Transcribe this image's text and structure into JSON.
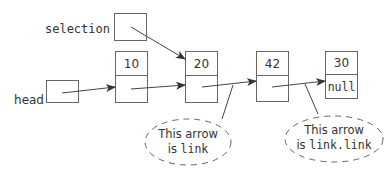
{
  "diagram": {
    "pointers": [
      {
        "name": "selection",
        "label": "selection"
      },
      {
        "name": "head",
        "label": "head"
      }
    ],
    "nodes": [
      {
        "data": "10",
        "link": ""
      },
      {
        "data": "20",
        "link": ""
      },
      {
        "data": "42",
        "link": ""
      },
      {
        "data": "30",
        "link": "null"
      }
    ],
    "callouts": [
      {
        "prefix": "This arrow",
        "line2_text": "is ",
        "line2_code": "link"
      },
      {
        "prefix": "This arrow",
        "line2_text": "is ",
        "line2_code": "link.link"
      }
    ],
    "colors": {
      "stroke": "#555555",
      "text": "#333333",
      "arrow": "#333333"
    }
  }
}
